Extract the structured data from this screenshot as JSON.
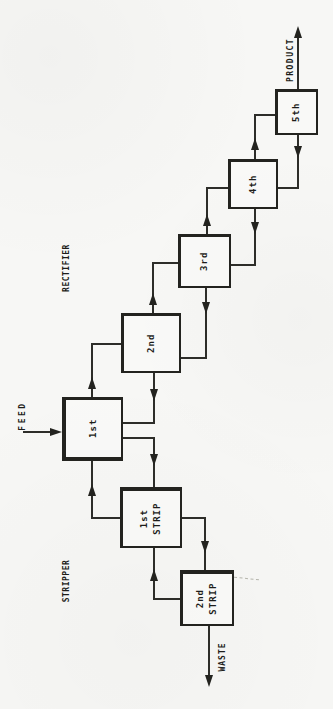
{
  "diagram": {
    "type": "process-flow-cascade",
    "sections": [
      {
        "label": "RECTIFIER"
      },
      {
        "label": "STRIPPER"
      }
    ],
    "streams": [
      {
        "label": "FEED"
      },
      {
        "label": "PRODUCT"
      },
      {
        "label": "WASTE"
      }
    ],
    "stages": [
      {
        "id": "1st",
        "label": "1st"
      },
      {
        "id": "2nd",
        "label": "2nd"
      },
      {
        "id": "3rd",
        "label": "3rd"
      },
      {
        "id": "4th",
        "label": "4th"
      },
      {
        "id": "5th",
        "label": "5th"
      },
      {
        "id": "1st-strip",
        "label": "1st\nSTRIP"
      },
      {
        "id": "2nd-strip",
        "label": "2nd\nSTRIP"
      }
    ],
    "connections": [
      {
        "from": "FEED",
        "to": "1st",
        "type": "feed"
      },
      {
        "from": "1st",
        "to": "2nd",
        "type": "vapor-up"
      },
      {
        "from": "2nd",
        "to": "3rd",
        "type": "vapor-up"
      },
      {
        "from": "3rd",
        "to": "4th",
        "type": "vapor-up"
      },
      {
        "from": "4th",
        "to": "5th",
        "type": "vapor-up"
      },
      {
        "from": "5th",
        "to": "PRODUCT",
        "type": "product-out"
      },
      {
        "from": "5th",
        "to": "4th",
        "type": "liquid-down"
      },
      {
        "from": "4th",
        "to": "3rd",
        "type": "liquid-down"
      },
      {
        "from": "3rd",
        "to": "2nd",
        "type": "liquid-down"
      },
      {
        "from": "2nd",
        "to": "1st",
        "type": "liquid-down"
      },
      {
        "from": "1st",
        "to": "1st-strip",
        "type": "liquid-down"
      },
      {
        "from": "1st-strip",
        "to": "1st",
        "type": "vapor-up"
      },
      {
        "from": "1st-strip",
        "to": "2nd-strip",
        "type": "liquid-down"
      },
      {
        "from": "2nd-strip",
        "to": "1st-strip",
        "type": "vapor-up"
      },
      {
        "from": "2nd-strip",
        "to": "WASTE",
        "type": "waste-out"
      }
    ],
    "colors": {
      "ink": "#23231f",
      "paper": "#f7f7f5"
    }
  }
}
